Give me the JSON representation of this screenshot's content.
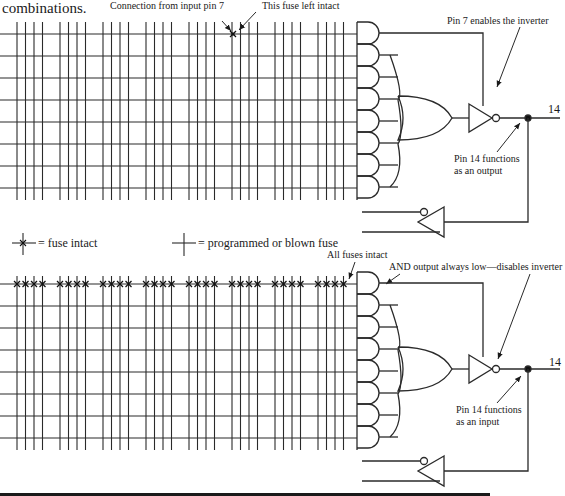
{
  "header": {
    "partial_text": "combinations."
  },
  "legend": {
    "fuse_intact": "= fuse intact",
    "fuse_blown": "= programmed or blown fuse"
  },
  "top_diagram": {
    "annotation_connection": "Connection from input pin 7",
    "annotation_fuse": "This fuse left intact",
    "annotation_enable": "Pin 7 enables the inverter",
    "pin_label": "14",
    "pin_function_line1": "Pin 14 functions",
    "pin_function_line2": "as an output"
  },
  "bottom_diagram": {
    "annotation_all_fuses": "All fuses intact",
    "annotation_and_output": "AND output always low—disables inverter",
    "pin_label": "14",
    "pin_function_line1": "Pin 14 functions",
    "pin_function_line2": "as an input"
  },
  "grid": {
    "column_groups": 8,
    "columns_per_group": 4,
    "rows_per_array": 8,
    "top_intact_fuse": {
      "row": 1,
      "column": "group 6, col 1"
    },
    "bottom_intact_row": 1
  },
  "colors": {
    "line": "#2a2a2a",
    "background": "#ffffff"
  }
}
